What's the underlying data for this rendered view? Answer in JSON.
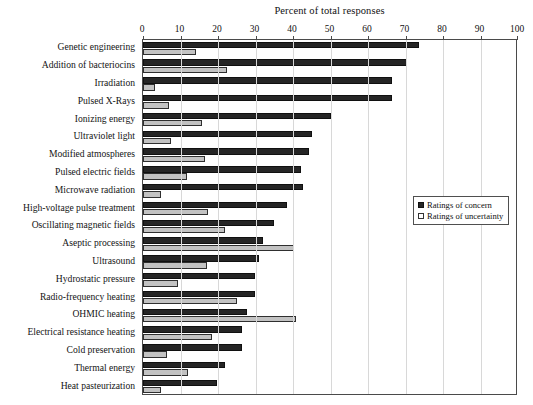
{
  "chart_data": {
    "type": "bar",
    "orientation": "horizontal",
    "title": "",
    "xlabel": "Percent of total responses",
    "ylabel": "",
    "xlim": [
      0,
      100
    ],
    "xticks": [
      0,
      10,
      20,
      30,
      40,
      50,
      60,
      70,
      80,
      90,
      100
    ],
    "grid": true,
    "legend_position": "middle-right",
    "categories": [
      "Genetic engineering",
      "Addition of bacteriocins",
      "Irradiation",
      "Pulsed X-Rays",
      "Ionizing energy",
      "Ultraviolet light",
      "Modified atmospheres",
      "Pulsed electric fields",
      "Microwave radiation",
      "High-voltage pulse treatment",
      "Oscillating magnetic fields",
      "Aseptic processing",
      "Ultrasound",
      "Hydrostatic pressure",
      "Radio-frequency heating",
      "OHMIC heating",
      "Electrical resistance heating",
      "Cold preservation",
      "Thermal energy",
      "Heat pasteurization"
    ],
    "series": [
      {
        "name": "Ratings of concern",
        "color": "#252525",
        "values": [
          73.5,
          70.5,
          66.3,
          66.3,
          50.0,
          45.0,
          44.2,
          42.1,
          42.6,
          38.3,
          35.0,
          32.0,
          30.8,
          29.8,
          29.9,
          27.7,
          26.3,
          26.3,
          21.9,
          19.8
        ]
      },
      {
        "name": "Ratings of uncertainty",
        "color": "#c2c2c2",
        "values": [
          14.2,
          22.3,
          3.2,
          7.0,
          15.6,
          7.5,
          16.5,
          11.6,
          4.9,
          17.4,
          21.9,
          40.2,
          17.0,
          9.4,
          25.0,
          40.7,
          18.5,
          6.4,
          12.1,
          4.9
        ]
      }
    ]
  },
  "legend": {
    "items": [
      {
        "label": "Ratings of concern",
        "swatch": "filled-square-icon"
      },
      {
        "label": "Ratings of uncertainty",
        "swatch": "open-square-icon"
      }
    ]
  }
}
